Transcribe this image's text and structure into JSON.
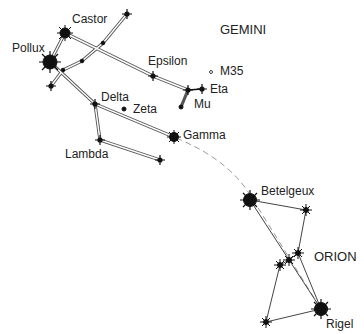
{
  "gemini": {
    "title": "GEMINI",
    "labels": {
      "castor": "Castor",
      "pollux": "Pollux",
      "epsilon": "Epsilon",
      "m35": "M35",
      "eta": "Eta",
      "mu": "Mu",
      "delta": "Delta",
      "zeta": "Zeta",
      "gamma": "Gamma",
      "lambda": "Lambda"
    }
  },
  "orion": {
    "title": "ORION",
    "labels": {
      "betelgeux": "Betelgeux",
      "rigel": "Rigel"
    }
  },
  "colors": {
    "ink": "#111111",
    "line": "#555555",
    "dashed": "#999999"
  }
}
